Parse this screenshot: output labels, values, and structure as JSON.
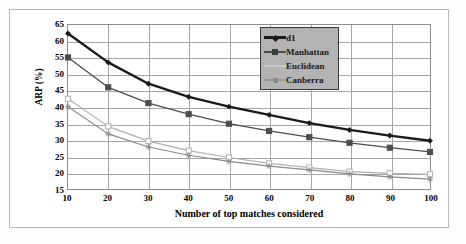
{
  "chart_data": {
    "type": "line",
    "title": "",
    "xlabel": "Number of top matches considered",
    "ylabel": "ARP (%)",
    "x": [
      10,
      20,
      30,
      40,
      50,
      60,
      70,
      80,
      90,
      100
    ],
    "xlim": [
      10,
      100
    ],
    "ylim": [
      15,
      65
    ],
    "xticks": [
      "10",
      "20",
      "30",
      "40",
      "50",
      "60",
      "70",
      "80",
      "90",
      "100"
    ],
    "yticks": [
      "65",
      "60",
      "55",
      "50",
      "45",
      "40",
      "35",
      "30",
      "25",
      "20",
      "15"
    ],
    "grid": "both",
    "legend_position": "top-right-inside",
    "series": [
      {
        "name": "d1",
        "color": "#1a1a1a",
        "marker": "diamond",
        "width": 2.4,
        "values": [
          62.4,
          53.6,
          47.1,
          43.1,
          40.1,
          37.6,
          35.1,
          33.0,
          31.3,
          29.7
        ]
      },
      {
        "name": "Manhattan",
        "color": "#4d4d4d",
        "marker": "square",
        "width": 1.3,
        "values": [
          55.1,
          46.0,
          41.2,
          37.8,
          34.9,
          32.7,
          30.8,
          29.1,
          27.6,
          26.3
        ]
      },
      {
        "name": "Euclidean",
        "color": "#b0b0b0",
        "marker": "square-open",
        "width": 1.2,
        "values": [
          42.5,
          34.1,
          29.6,
          26.7,
          24.6,
          22.8,
          21.5,
          20.3,
          19.8,
          19.5
        ]
      },
      {
        "name": "Canberra",
        "color": "#8a8a8a",
        "marker": "star",
        "width": 1.2,
        "values": [
          40.1,
          31.8,
          27.8,
          25.3,
          23.4,
          22.0,
          20.8,
          19.6,
          18.7,
          18.0
        ]
      }
    ]
  },
  "legend": {
    "entries": [
      {
        "label": "d1"
      },
      {
        "label": "Manhattan"
      },
      {
        "label": "Euclidean"
      },
      {
        "label": "Canberra"
      }
    ]
  }
}
